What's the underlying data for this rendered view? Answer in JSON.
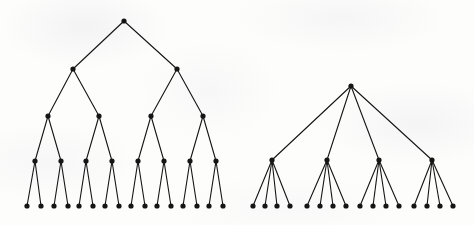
{
  "figure": {
    "width": 474,
    "height": 225,
    "background_color": "#fdfdfc",
    "ink_color": "#151515",
    "node_radius": 2.6,
    "edge_width": 1.1
  },
  "chart_data": {
    "type": "diagram",
    "title": "",
    "subtitle": "",
    "xlabel": "",
    "ylabel": "",
    "legend": [],
    "annotations": [],
    "trees": [
      {
        "name": "left-tree",
        "label": "complete binary tree of depth 4",
        "branching_factor": 2,
        "depth": 4,
        "node_count": 31,
        "leaf_count": 16,
        "levels": [
          {
            "depth": 0,
            "y": 21,
            "nodes": [
              {
                "id": "L0-0",
                "x": 124
              }
            ]
          },
          {
            "depth": 1,
            "y": 69,
            "nodes": [
              {
                "id": "L1-0",
                "x": 73,
                "parent": "L0-0"
              },
              {
                "id": "L1-1",
                "x": 177,
                "parent": "L0-0"
              }
            ]
          },
          {
            "depth": 2,
            "y": 116,
            "nodes": [
              {
                "id": "L2-0",
                "x": 48,
                "parent": "L1-0"
              },
              {
                "id": "L2-1",
                "x": 99,
                "parent": "L1-0"
              },
              {
                "id": "L2-2",
                "x": 151,
                "parent": "L1-1"
              },
              {
                "id": "L2-3",
                "x": 203,
                "parent": "L1-1"
              }
            ]
          },
          {
            "depth": 3,
            "y": 161,
            "nodes": [
              {
                "id": "L3-0",
                "x": 35,
                "parent": "L2-0"
              },
              {
                "id": "L3-1",
                "x": 61,
                "parent": "L2-0"
              },
              {
                "id": "L3-2",
                "x": 86,
                "parent": "L2-1"
              },
              {
                "id": "L3-3",
                "x": 112,
                "parent": "L2-1"
              },
              {
                "id": "L3-4",
                "x": 138,
                "parent": "L2-2"
              },
              {
                "id": "L3-5",
                "x": 164,
                "parent": "L2-2"
              },
              {
                "id": "L3-6",
                "x": 190,
                "parent": "L2-3"
              },
              {
                "id": "L3-7",
                "x": 216,
                "parent": "L2-3"
              }
            ]
          },
          {
            "depth": 4,
            "y": 206,
            "nodes": [
              {
                "id": "L4-0",
                "x": 27,
                "parent": "L3-0"
              },
              {
                "id": "L4-1",
                "x": 41,
                "parent": "L3-0"
              },
              {
                "id": "L4-2",
                "x": 54,
                "parent": "L3-1"
              },
              {
                "id": "L4-3",
                "x": 68,
                "parent": "L3-1"
              },
              {
                "id": "L4-4",
                "x": 79,
                "parent": "L3-2"
              },
              {
                "id": "L4-5",
                "x": 93,
                "parent": "L3-2"
              },
              {
                "id": "L4-6",
                "x": 105,
                "parent": "L3-3"
              },
              {
                "id": "L4-7",
                "x": 119,
                "parent": "L3-3"
              },
              {
                "id": "L4-8",
                "x": 131,
                "parent": "L3-4"
              },
              {
                "id": "L4-9",
                "x": 145,
                "parent": "L3-4"
              },
              {
                "id": "L4-10",
                "x": 157,
                "parent": "L3-5"
              },
              {
                "id": "L4-11",
                "x": 171,
                "parent": "L3-5"
              },
              {
                "id": "L4-12",
                "x": 183,
                "parent": "L3-6"
              },
              {
                "id": "L4-13",
                "x": 197,
                "parent": "L3-6"
              },
              {
                "id": "L4-14",
                "x": 209,
                "parent": "L3-7"
              },
              {
                "id": "L4-15",
                "x": 223,
                "parent": "L3-7"
              }
            ]
          }
        ]
      },
      {
        "name": "right-tree",
        "label": "complete 4-ary tree of depth 2",
        "branching_factor": 4,
        "depth": 2,
        "node_count": 21,
        "leaf_count": 16,
        "levels": [
          {
            "depth": 0,
            "y": 86,
            "nodes": [
              {
                "id": "R0-0",
                "x": 351
              }
            ]
          },
          {
            "depth": 1,
            "y": 160,
            "nodes": [
              {
                "id": "R1-0",
                "x": 272,
                "parent": "R0-0"
              },
              {
                "id": "R1-1",
                "x": 327,
                "parent": "R0-0"
              },
              {
                "id": "R1-2",
                "x": 379,
                "parent": "R0-0"
              },
              {
                "id": "R1-3",
                "x": 432,
                "parent": "R0-0"
              }
            ]
          },
          {
            "depth": 2,
            "y": 206,
            "nodes": [
              {
                "id": "R2-0",
                "x": 253,
                "parent": "R1-0"
              },
              {
                "id": "R2-1",
                "x": 265,
                "parent": "R1-0"
              },
              {
                "id": "R2-2",
                "x": 277,
                "parent": "R1-0"
              },
              {
                "id": "R2-3",
                "x": 290,
                "parent": "R1-0"
              },
              {
                "id": "R2-4",
                "x": 307,
                "parent": "R1-1"
              },
              {
                "id": "R2-5",
                "x": 320,
                "parent": "R1-1"
              },
              {
                "id": "R2-6",
                "x": 333,
                "parent": "R1-1"
              },
              {
                "id": "R2-7",
                "x": 346,
                "parent": "R1-1"
              },
              {
                "id": "R2-8",
                "x": 360,
                "parent": "R1-2"
              },
              {
                "id": "R2-9",
                "x": 373,
                "parent": "R1-2"
              },
              {
                "id": "R2-10",
                "x": 386,
                "parent": "R1-2"
              },
              {
                "id": "R2-11",
                "x": 399,
                "parent": "R1-2"
              },
              {
                "id": "R2-12",
                "x": 414,
                "parent": "R1-3"
              },
              {
                "id": "R2-13",
                "x": 427,
                "parent": "R1-3"
              },
              {
                "id": "R2-14",
                "x": 440,
                "parent": "R1-3"
              },
              {
                "id": "R2-15",
                "x": 453,
                "parent": "R1-3"
              }
            ]
          }
        ]
      }
    ]
  }
}
